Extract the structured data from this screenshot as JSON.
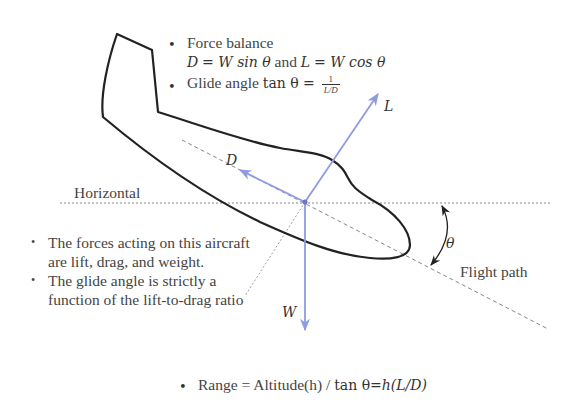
{
  "diagram": {
    "title_bullets": [
      {
        "text": "Force balance"
      },
      {
        "text": "Glide angle"
      }
    ],
    "force_balance": {
      "label": "Force balance",
      "eq_drag_lhs": "D",
      "eq_drag_rhs": "W sin θ",
      "connector": "and",
      "eq_lift_lhs": "L",
      "eq_lift_rhs": "W cos θ"
    },
    "glide_angle": {
      "label": "Glide angle",
      "func": "tan θ =",
      "numerator": "1",
      "denominator": "L/D"
    },
    "labels": {
      "horizontal": "Horizontal",
      "flight_path": "Flight path",
      "lift": "L",
      "drag": "D",
      "weight": "W",
      "theta": "θ"
    },
    "left_bullets": [
      "The forces acting on this aircraft are lift, drag, and weight.",
      "The glide angle is strictly a function of the lift-to-drag ratio"
    ],
    "range_formula": {
      "prefix": "Range",
      "equals": "=",
      "middle": "Altitude(h) /",
      "func": "tan θ",
      "result": "=h(L/D)"
    },
    "colors": {
      "vector": "#8e9be0",
      "outline": "#222222",
      "guide": "#777777",
      "text": "#444444"
    }
  }
}
